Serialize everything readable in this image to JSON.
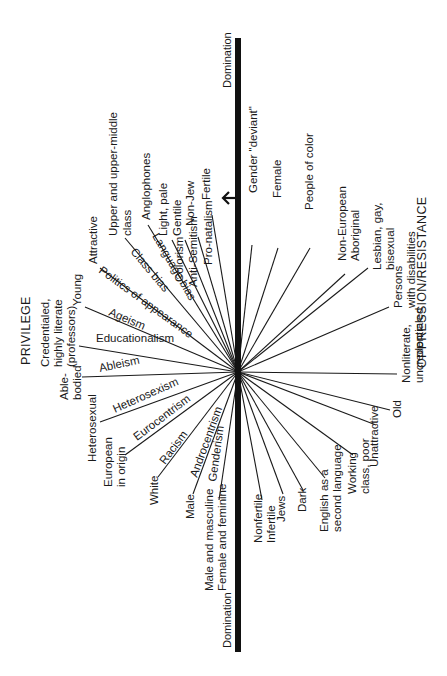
{
  "titles": {
    "privilege": "PRIVILEGE",
    "oppression": "OPPRESSION/RESISTANCE"
  },
  "axis": {
    "top_label": "Domination",
    "bottom_label": "Domination",
    "color": "#111111"
  },
  "privilege_side": [
    {
      "label1": "Upper and upper-middle",
      "label2": "class"
    },
    {
      "label1": "Anglophones",
      "label2": ""
    },
    {
      "label1": "Light, pale",
      "label2": ""
    },
    {
      "label1": "Gentile",
      "label2": ""
    },
    {
      "label1": "Non-Jew",
      "label2": ""
    },
    {
      "label1": "Fertile",
      "label2": ""
    },
    {
      "label1": "Attractive",
      "label2": ""
    },
    {
      "label1": "Young",
      "label2": ""
    },
    {
      "label1": "Credentialed,",
      "label2": "highly literate",
      "label3": "(professors)"
    },
    {
      "label1": "Able-",
      "label2": "bodied"
    },
    {
      "label1": "Heterosexual",
      "label2": ""
    },
    {
      "label1": "European",
      "label2": "in origin"
    },
    {
      "label1": "White",
      "label2": ""
    },
    {
      "label1": "Male",
      "label2": ""
    },
    {
      "label1": "Male and masculine",
      "label2": "Female and feminine"
    }
  ],
  "isms": [
    "Class bias",
    "Language bias",
    "Colorism",
    "Anti-Semitism",
    "Pro-natalism",
    "Politics of appearance",
    "Ageism",
    "Educationalism",
    "Ableism",
    "Heterosexism",
    "Eurocentrism",
    "Racism",
    "Androcentrism",
    "Genderism"
  ],
  "oppression_side": [
    {
      "label1": "Gender \"deviant\"",
      "label2": ""
    },
    {
      "label1": "Female",
      "label2": ""
    },
    {
      "label1": "People of color",
      "label2": ""
    },
    {
      "label1": "Non-European",
      "label2": "Aboriginal"
    },
    {
      "label1": "Lesbian, gay,",
      "label2": "bisexual"
    },
    {
      "label1": "Persons",
      "label2": "with disabilities"
    },
    {
      "label1": "Nonliterate,",
      "label2": "uncredentialed"
    },
    {
      "label1": "Old",
      "label2": ""
    },
    {
      "label1": "Unattractive",
      "label2": ""
    },
    {
      "label1": "Working",
      "label2": "class, poor"
    },
    {
      "label1": "English as a",
      "label2": "second language"
    },
    {
      "label1": "Dark",
      "label2": ""
    },
    {
      "label1": "Jews",
      "label2": ""
    },
    {
      "label1": "Nonfertile",
      "label2": "Infertile"
    }
  ],
  "arrow": {
    "direction": "left",
    "glyph": "arrow-left"
  }
}
